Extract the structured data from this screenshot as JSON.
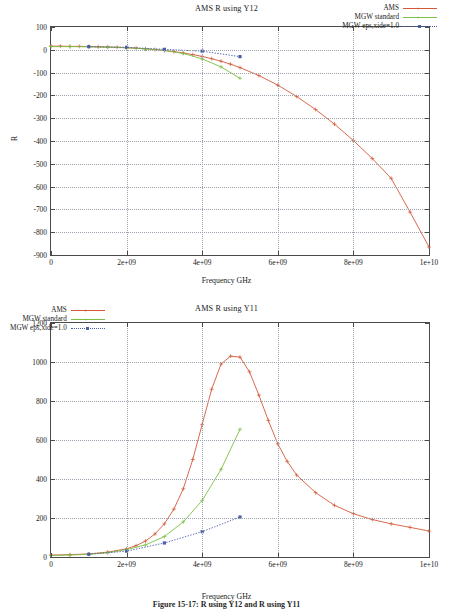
{
  "figure": {
    "caption": "Figure 15-17:  R using Y12 and R using Y11"
  },
  "colors": {
    "ams": "#d4593a",
    "mgw_standard": "#7bc043",
    "mgw_eps": "#4a5fa8",
    "frame": "#4a4a4a",
    "grid": "#9aa3ad",
    "background": "#ffffff"
  },
  "charts": [
    {
      "id": "top",
      "title": "AMS R using Y12",
      "xlabel": "Frequency GHz",
      "ylabel": "R",
      "legend_position": "top-right",
      "legend": [
        {
          "label": "AMS",
          "color": "#d4593a",
          "marker": "plus",
          "style": "solid"
        },
        {
          "label": "MGW standard",
          "color": "#7bc043",
          "marker": "plus",
          "style": "solid"
        },
        {
          "label": "MGW eps,xide=1.0",
          "color": "#4a5fa8",
          "marker": "square",
          "style": "dotted"
        }
      ],
      "xticks": [
        "0",
        "2e+09",
        "4e+09",
        "6e+09",
        "8e+09",
        "1e+10"
      ],
      "yticks": [
        "100",
        "0",
        "-100",
        "-200",
        "-300",
        "-400",
        "-500",
        "-600",
        "-700",
        "-800",
        "-900"
      ]
    },
    {
      "id": "bottom",
      "title": "AMS R using Y11",
      "xlabel": "Frequency GHz",
      "ylabel": "R",
      "legend_position": "top-left",
      "legend": [
        {
          "label": "AMS",
          "color": "#d4593a",
          "marker": "plus",
          "style": "solid"
        },
        {
          "label": "MGW standard",
          "color": "#7bc043",
          "marker": "plus",
          "style": "solid"
        },
        {
          "label": "MGW eps,xide=1.0",
          "color": "#4a5fa8",
          "marker": "square",
          "style": "dotted"
        }
      ],
      "xticks": [
        "0",
        "2e+09",
        "4e+09",
        "6e+09",
        "8e+09",
        "1e+10"
      ],
      "yticks": [
        "1200",
        "1000",
        "800",
        "600",
        "400",
        "200",
        "0"
      ]
    }
  ],
  "chart_data": [
    {
      "type": "line",
      "title": "AMS R using Y12",
      "xlabel": "Frequency GHz",
      "ylabel": "R",
      "xlim": [
        0,
        10000000000
      ],
      "ylim": [
        -900,
        100
      ],
      "grid": true,
      "legend": "top right",
      "series": [
        {
          "name": "AMS",
          "color": "#d4593a",
          "marker": "plus",
          "x": [
            0,
            250000000,
            500000000,
            750000000,
            1000000000,
            1250000000,
            1500000000,
            1750000000,
            2000000000,
            2250000000,
            2500000000,
            2750000000,
            3000000000,
            3250000000,
            3500000000,
            3750000000,
            4000000000,
            4250000000,
            4500000000,
            4750000000,
            5000000000,
            5500000000,
            6000000000,
            6500000000,
            7000000000,
            7500000000,
            8000000000,
            8500000000,
            9000000000,
            9500000000,
            10000000000
          ],
          "y": [
            16,
            16,
            15,
            15,
            14,
            13,
            12,
            11,
            9,
            7,
            4,
            1,
            -3,
            -8,
            -14,
            -21,
            -29,
            -39,
            -50,
            -63,
            -78,
            -113,
            -155,
            -205,
            -262,
            -326,
            -398,
            -477,
            -564,
            -712,
            -865
          ]
        },
        {
          "name": "MGW standard",
          "color": "#7bc043",
          "marker": "plus",
          "x": [
            0,
            500000000,
            1000000000,
            1500000000,
            2000000000,
            2500000000,
            3000000000,
            3500000000,
            4000000000,
            4500000000,
            5000000000
          ],
          "y": [
            14,
            14,
            13,
            11,
            9,
            4,
            -3,
            -16,
            -40,
            -75,
            -125
          ]
        },
        {
          "name": "MGW eps,xide=1.0",
          "color": "#4a5fa8",
          "marker": "square",
          "style": "dotted",
          "x": [
            1000000000,
            2000000000,
            3000000000,
            4000000000,
            5000000000
          ],
          "y": [
            14,
            11,
            2,
            -6,
            -30
          ]
        }
      ]
    },
    {
      "type": "line",
      "title": "AMS R using Y11",
      "xlabel": "Frequency GHz",
      "ylabel": "R",
      "xlim": [
        0,
        10000000000
      ],
      "ylim": [
        0,
        1200
      ],
      "grid": true,
      "legend": "top left",
      "series": [
        {
          "name": "AMS",
          "color": "#d4593a",
          "marker": "plus",
          "x": [
            0,
            500000000,
            1000000000,
            1500000000,
            2000000000,
            2250000000,
            2500000000,
            2750000000,
            3000000000,
            3250000000,
            3500000000,
            3750000000,
            4000000000,
            4250000000,
            4500000000,
            4750000000,
            5000000000,
            5250000000,
            5500000000,
            5750000000,
            6000000000,
            6250000000,
            6500000000,
            7000000000,
            7500000000,
            8000000000,
            8500000000,
            9000000000,
            9500000000,
            10000000000
          ],
          "y": [
            10,
            12,
            16,
            25,
            42,
            58,
            82,
            118,
            170,
            245,
            350,
            500,
            680,
            860,
            990,
            1030,
            1025,
            950,
            830,
            700,
            580,
            490,
            420,
            330,
            265,
            222,
            192,
            170,
            152,
            133
          ]
        },
        {
          "name": "MGW standard",
          "color": "#7bc043",
          "marker": "plus",
          "x": [
            0,
            500000000,
            1000000000,
            1500000000,
            2000000000,
            2500000000,
            3000000000,
            3500000000,
            4000000000,
            4500000000,
            5000000000
          ],
          "y": [
            8,
            10,
            14,
            22,
            38,
            62,
            105,
            180,
            290,
            450,
            655
          ]
        },
        {
          "name": "MGW eps,xide=1.0",
          "color": "#4a5fa8",
          "marker": "square",
          "style": "dotted",
          "x": [
            1000000000,
            2000000000,
            3000000000,
            4000000000,
            5000000000
          ],
          "y": [
            14,
            30,
            72,
            130,
            205
          ]
        }
      ]
    }
  ]
}
